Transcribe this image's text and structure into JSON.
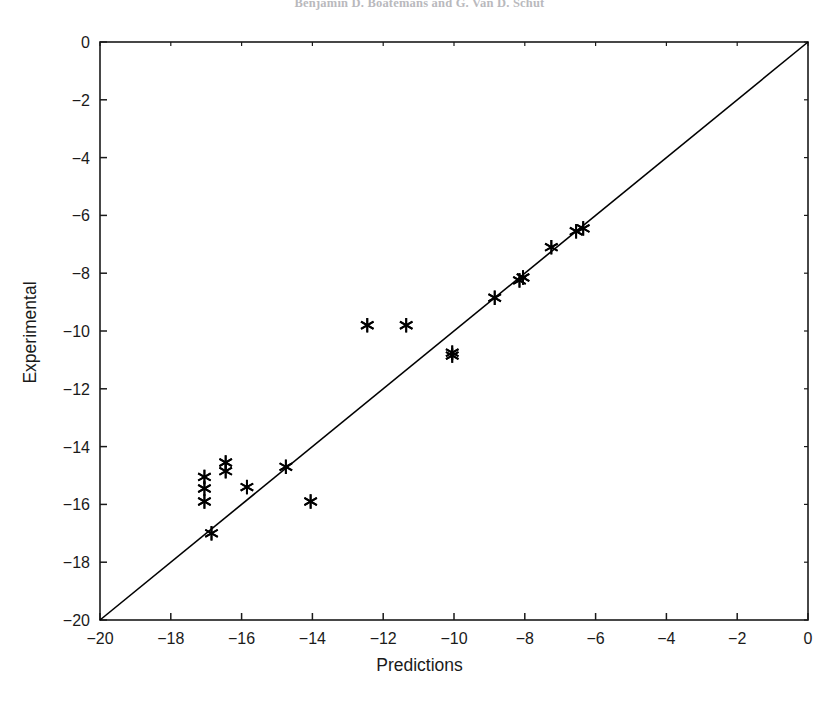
{
  "header": {
    "running_head": "Benjamin D. Boatemans and G. Van D. Schut"
  },
  "chart_data": {
    "type": "scatter",
    "title": "",
    "xlabel": "Predictions",
    "ylabel": "Experimental",
    "xlim": [
      -20,
      0
    ],
    "ylim": [
      -20,
      0
    ],
    "xticks": [
      -20,
      -18,
      -16,
      -14,
      -12,
      -10,
      -8,
      -6,
      -4,
      -2,
      0
    ],
    "yticks": [
      -20,
      -18,
      -16,
      -14,
      -12,
      -10,
      -8,
      -6,
      -4,
      -2,
      0
    ],
    "xticklabels": [
      "-20",
      "-18",
      "-16",
      "-14",
      "-12",
      "-10",
      "-8",
      "-6",
      "-4",
      "-2",
      "0"
    ],
    "yticklabels": [
      "-20",
      "-18",
      "-16",
      "-14",
      "-12",
      "-10",
      "-8",
      "-6",
      "-4",
      "-2",
      "0"
    ],
    "grid": false,
    "legend": null,
    "marker": "asterisk",
    "marker_color": "#000000",
    "line_color": "#000000",
    "reference_line": {
      "label": "y = x identity line",
      "x": [
        -20,
        0
      ],
      "y": [
        -20,
        0
      ]
    },
    "series": [
      {
        "name": "Predicted vs Experimental",
        "x": [
          -17.05,
          -17.05,
          -16.45,
          -16.45,
          -17.05,
          -16.85,
          -15.85,
          -14.75,
          -14.05,
          -12.45,
          -11.35,
          -10.05,
          -10.05,
          -8.85,
          -8.15,
          -8.05,
          -7.25,
          -6.55,
          -6.35
        ],
        "y": [
          -15.05,
          -15.45,
          -14.55,
          -14.85,
          -15.9,
          -17.0,
          -15.4,
          -14.7,
          -15.9,
          -9.8,
          -9.8,
          -10.75,
          -10.85,
          -8.85,
          -8.25,
          -8.15,
          -7.1,
          -6.55,
          -6.45
        ]
      }
    ],
    "points": [
      {
        "x": -17.05,
        "y": -15.05
      },
      {
        "x": -17.05,
        "y": -15.45
      },
      {
        "x": -16.45,
        "y": -14.55
      },
      {
        "x": -16.45,
        "y": -14.85
      },
      {
        "x": -17.05,
        "y": -15.9
      },
      {
        "x": -16.85,
        "y": -17.0
      },
      {
        "x": -15.85,
        "y": -15.4
      },
      {
        "x": -14.75,
        "y": -14.7
      },
      {
        "x": -14.05,
        "y": -15.9
      },
      {
        "x": -12.45,
        "y": -9.8
      },
      {
        "x": -11.35,
        "y": -9.8
      },
      {
        "x": -10.05,
        "y": -10.75
      },
      {
        "x": -10.05,
        "y": -10.85
      },
      {
        "x": -8.85,
        "y": -8.85
      },
      {
        "x": -8.15,
        "y": -8.25
      },
      {
        "x": -8.05,
        "y": -8.15
      },
      {
        "x": -7.25,
        "y": -7.1
      },
      {
        "x": -6.55,
        "y": -6.55
      },
      {
        "x": -6.35,
        "y": -6.45
      }
    ]
  },
  "plot_geometry": {
    "left_px": 100,
    "right_px": 808,
    "top_px": 42,
    "bottom_px": 620
  }
}
